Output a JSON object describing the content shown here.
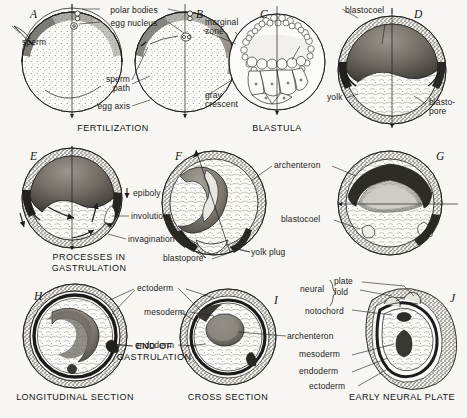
{
  "figure": {
    "background_color": "#f7f6f2",
    "ink_color": "#1c1c1c",
    "width": 467,
    "height": 418
  },
  "captions": [
    {
      "id": "fertilization",
      "text": "FERTILIZATION",
      "x": 113,
      "y": 123
    },
    {
      "id": "blastula",
      "text": "BLASTULA",
      "x": 277,
      "y": 123
    },
    {
      "id": "processes-in-gastrulation",
      "line1": "PROCESSES  IN",
      "line2": "GASTRULATION",
      "x": 89,
      "y": 252
    },
    {
      "id": "end-of-gastrulation",
      "line1": "END  OF",
      "line2": "GASTRULATION",
      "x": 154,
      "y": 341
    },
    {
      "id": "longitudinal-section",
      "text": "LONGITUDINAL  SECTION",
      "x": 75,
      "y": 392
    },
    {
      "id": "cross-section",
      "text": "CROSS SECTION",
      "x": 228,
      "y": 392
    },
    {
      "id": "early-neural-plate",
      "text": "EARLY NEURAL PLATE",
      "x": 402,
      "y": 392
    }
  ],
  "panels": [
    {
      "id": "A",
      "letter": "A",
      "x": 30,
      "y": 8
    },
    {
      "id": "B",
      "letter": "B",
      "x": 196,
      "y": 8
    },
    {
      "id": "C",
      "letter": "C",
      "x": 260,
      "y": 8
    },
    {
      "id": "D",
      "letter": "D",
      "x": 414,
      "y": 8
    },
    {
      "id": "E",
      "letter": "E",
      "x": 30,
      "y": 150
    },
    {
      "id": "F",
      "letter": "F",
      "x": 175,
      "y": 150
    },
    {
      "id": "G",
      "letter": "G",
      "x": 436,
      "y": 150
    },
    {
      "id": "H",
      "letter": "H",
      "x": 34,
      "y": 290
    },
    {
      "id": "I",
      "letter": "I",
      "x": 274,
      "y": 294
    },
    {
      "id": "J",
      "letter": "J",
      "x": 450,
      "y": 292
    }
  ],
  "labels": [
    {
      "id": "polar-bodies",
      "text": "polar bodies",
      "x": 134,
      "y": 6,
      "align": "center"
    },
    {
      "id": "egg-nucleus",
      "text": "egg nucleus",
      "x": 134,
      "y": 19,
      "align": "center"
    },
    {
      "id": "sperm",
      "text": "sperm",
      "x": 22,
      "y": 38,
      "align": "left"
    },
    {
      "id": "sperm-path",
      "line1": "sperm",
      "line2": "path",
      "x": 130,
      "y": 81,
      "align": "right"
    },
    {
      "id": "egg-axis",
      "text": "egg axis",
      "x": 130,
      "y": 104,
      "align": "right"
    },
    {
      "id": "marginal-zone",
      "line1": "marginal",
      "line2": "zone",
      "x": 205,
      "y": 22,
      "align": "left"
    },
    {
      "id": "gray-crescent",
      "line1": "gray",
      "line2": "crescent",
      "x": 205,
      "y": 95,
      "align": "left"
    },
    {
      "id": "blastocoel-d",
      "text": "blastocoel",
      "x": 345,
      "y": 6,
      "align": "left"
    },
    {
      "id": "yolk",
      "text": "yolk",
      "x": 329,
      "y": 95,
      "align": "left"
    },
    {
      "id": "blastopore-d",
      "line1": "blasto-",
      "line2": "pore",
      "x": 429,
      "y": 100,
      "align": "left"
    },
    {
      "id": "epiboly",
      "text": "epiboly",
      "x": 133,
      "y": 191,
      "align": "left"
    },
    {
      "id": "involution",
      "text": "involution",
      "x": 131,
      "y": 214,
      "align": "left"
    },
    {
      "id": "invagination",
      "text": "invagination",
      "x": 128,
      "y": 237,
      "align": "left"
    },
    {
      "id": "archenteron-f",
      "text": "archenteron",
      "x": 274,
      "y": 163,
      "align": "left"
    },
    {
      "id": "blastocoel-g",
      "text": "blastocoel",
      "x": 283,
      "y": 217,
      "align": "left"
    },
    {
      "id": "blastopore-f",
      "text": "blastopore",
      "x": 164,
      "y": 256,
      "align": "left"
    },
    {
      "id": "yolk-plug",
      "text": "yolk  plug",
      "x": 251,
      "y": 250,
      "align": "left"
    },
    {
      "id": "ectoderm-h",
      "text": "ectoderm",
      "x": 137,
      "y": 286,
      "align": "left"
    },
    {
      "id": "mesoderm-h",
      "text": "mesoderm",
      "x": 144,
      "y": 310,
      "align": "left"
    },
    {
      "id": "endoderm-h",
      "text": "endoderm",
      "x": 135,
      "y": 343,
      "align": "left"
    },
    {
      "id": "neural",
      "text": "neural",
      "x": 302,
      "y": 287,
      "align": "left"
    },
    {
      "id": "neural-plate",
      "text": "plate",
      "x": 333,
      "y": 280,
      "align": "left"
    },
    {
      "id": "neural-fold",
      "text": "fold",
      "x": 333,
      "y": 290,
      "align": "left"
    },
    {
      "id": "notochord",
      "text": "notochord",
      "x": 307,
      "y": 309,
      "align": "left"
    },
    {
      "id": "archenteron-i",
      "text": "archenteron",
      "x": 287,
      "y": 334,
      "align": "left"
    },
    {
      "id": "mesoderm-j",
      "text": "mesoderm",
      "x": 301,
      "y": 352,
      "align": "left"
    },
    {
      "id": "endoderm-j",
      "text": "endoderm",
      "x": 301,
      "y": 369,
      "align": "left"
    },
    {
      "id": "ectoderm-j",
      "text": "ectoderm",
      "x": 311,
      "y": 384,
      "align": "left"
    }
  ]
}
